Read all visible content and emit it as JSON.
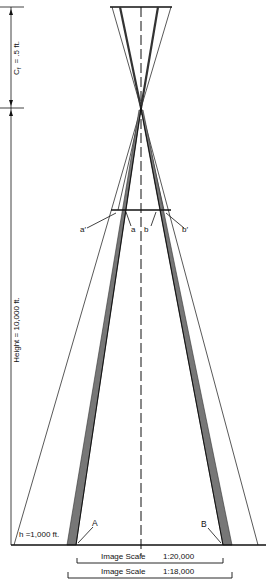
{
  "diagram": {
    "focal_label": "C",
    "focal_subscript": "f",
    "focal_value": "=    .5 ft.",
    "height_label": "Height    =    10,000 ft.",
    "h_label": "h =1,000 ft.",
    "point_a_prime": "a′",
    "point_a": "a",
    "point_b": "b",
    "point_b_prime": "b′",
    "point_A": "A",
    "point_B": "B",
    "scale1_label": "Image Scale",
    "scale1_value": "1:20,000",
    "scale2_label": "Image Scale",
    "scale2_value": "1:18,000"
  }
}
